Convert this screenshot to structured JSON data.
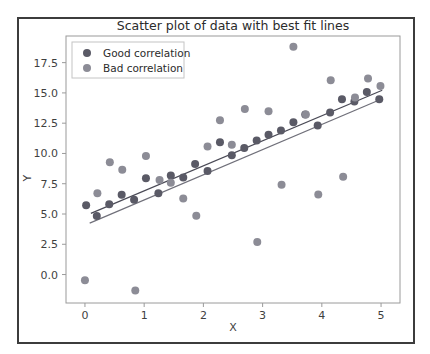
{
  "figure": {
    "width": 430,
    "height": 354,
    "background": "#ffffff",
    "frame_color": "#3c3c3c"
  },
  "chart_data": {
    "type": "scatter",
    "title": "Scatter plot of data with best fit lines",
    "xlabel": "X",
    "ylabel": "Y",
    "xlim": [
      -0.32,
      5.32
    ],
    "ylim": [
      -2.35,
      19.7
    ],
    "xticks": [
      0,
      1,
      2,
      3,
      4,
      5
    ],
    "xtick_labels": [
      "0",
      "1",
      "2",
      "3",
      "4",
      "5"
    ],
    "yticks": [
      0.0,
      2.5,
      5.0,
      7.5,
      10.0,
      12.5,
      15.0,
      17.5
    ],
    "ytick_labels": [
      "0.0",
      "2.5",
      "5.0",
      "7.5",
      "10.0",
      "12.5",
      "15.0",
      "17.5"
    ],
    "grid": false,
    "legend_position": "upper left",
    "marker_size": 7,
    "series": [
      {
        "name": "Good correlation",
        "color": "#5a5a66",
        "points": [
          [
            0.02,
            5.72
          ],
          [
            0.2,
            4.83
          ],
          [
            0.41,
            5.8
          ],
          [
            0.62,
            6.58
          ],
          [
            0.83,
            6.17
          ],
          [
            1.03,
            7.95
          ],
          [
            1.24,
            6.72
          ],
          [
            1.45,
            8.18
          ],
          [
            1.66,
            8.02
          ],
          [
            1.86,
            9.12
          ],
          [
            2.07,
            8.55
          ],
          [
            2.28,
            10.92
          ],
          [
            2.48,
            9.85
          ],
          [
            2.69,
            10.45
          ],
          [
            2.9,
            11.08
          ],
          [
            3.1,
            11.55
          ],
          [
            3.31,
            11.9
          ],
          [
            3.52,
            12.58
          ],
          [
            3.72,
            13.22
          ],
          [
            3.93,
            12.3
          ],
          [
            4.14,
            13.38
          ],
          [
            4.34,
            14.48
          ],
          [
            4.55,
            14.3
          ],
          [
            4.76,
            15.08
          ],
          [
            4.97,
            14.48
          ]
        ]
      },
      {
        "name": "Bad correlation",
        "color": "#8c8c96",
        "points": [
          [
            0.0,
            -0.48
          ],
          [
            0.21,
            6.72
          ],
          [
            0.42,
            9.28
          ],
          [
            0.63,
            8.65
          ],
          [
            0.85,
            -1.32
          ],
          [
            1.03,
            9.78
          ],
          [
            1.26,
            7.8
          ],
          [
            1.45,
            7.58
          ],
          [
            1.66,
            6.28
          ],
          [
            1.88,
            4.85
          ],
          [
            2.07,
            10.58
          ],
          [
            2.28,
            12.75
          ],
          [
            2.48,
            10.72
          ],
          [
            2.7,
            13.68
          ],
          [
            2.91,
            2.68
          ],
          [
            3.1,
            13.48
          ],
          [
            3.32,
            7.42
          ],
          [
            3.52,
            18.82
          ],
          [
            3.73,
            13.22
          ],
          [
            3.94,
            6.62
          ],
          [
            4.15,
            16.05
          ],
          [
            4.36,
            8.08
          ],
          [
            4.56,
            14.62
          ],
          [
            4.78,
            16.18
          ],
          [
            4.99,
            15.58
          ]
        ]
      }
    ],
    "fit_lines": [
      {
        "name": "Good correlation fit",
        "color": "#4a4a56",
        "x0": 0.1,
        "y0": 5.05,
        "x1": 5.02,
        "y1": 15.22
      },
      {
        "name": "Bad correlation fit",
        "color": "#70707a",
        "x0": 0.08,
        "y0": 4.25,
        "x1": 5.02,
        "y1": 14.52
      }
    ]
  },
  "legend": {
    "items": [
      {
        "label": "Good correlation",
        "color": "#5a5a66"
      },
      {
        "label": "Bad correlation",
        "color": "#8c8c96"
      }
    ]
  }
}
